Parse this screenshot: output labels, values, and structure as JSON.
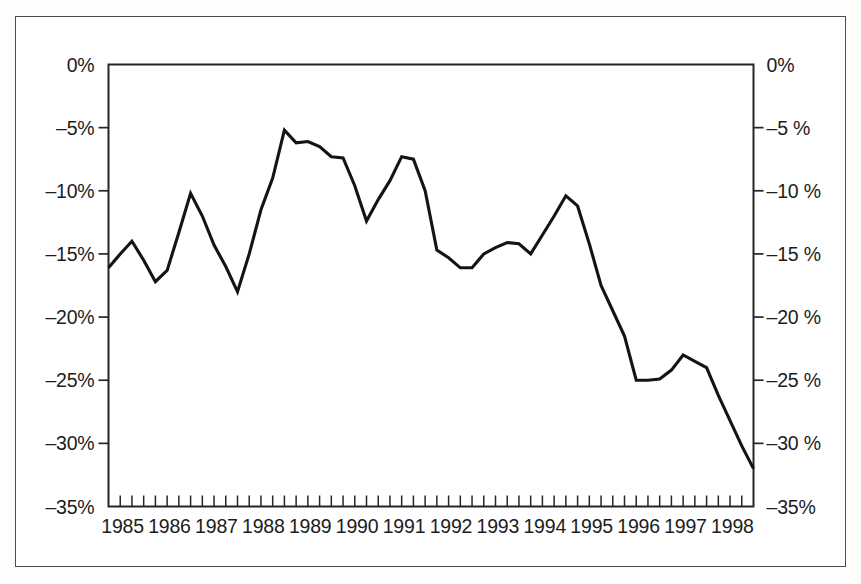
{
  "figure": {
    "background_color": "#ffffff",
    "border_color": "#4c4c4c",
    "line_color": "#141414"
  },
  "chart_data": {
    "type": "line",
    "title": "",
    "subtitle": "",
    "xlabel": "",
    "ylabel": "",
    "grid": false,
    "legend": null,
    "xlim": [
      1985.0,
      1998.75
    ],
    "ylim": [
      -35,
      0
    ],
    "y_tick_values": [
      0,
      -5,
      -10,
      -15,
      -20,
      -25,
      -30,
      -35
    ],
    "y_tick_labels_left": [
      "0%",
      "–5%",
      "–10%",
      "–15%",
      "–20%",
      "–25%",
      "–30%",
      "–35%"
    ],
    "y_tick_labels_right": [
      "0%",
      "–5 %",
      "–10 %",
      "–15 %",
      "–20 %",
      "–25 %",
      "–30 %",
      "–35%"
    ],
    "x_tick_labels": [
      "1985",
      "1986",
      "1987",
      "1988",
      "1989",
      "1990",
      "1991",
      "1992",
      "1993",
      "1994",
      "1995",
      "1996",
      "1997",
      "1998"
    ],
    "x_minor_ticks_per_year": 4,
    "series": [
      {
        "name": "series-1",
        "x": [
          1985.0,
          1985.25,
          1985.5,
          1985.75,
          1986.0,
          1986.25,
          1986.5,
          1986.75,
          1987.0,
          1987.25,
          1987.5,
          1987.75,
          1988.0,
          1988.25,
          1988.5,
          1988.75,
          1989.0,
          1989.25,
          1989.5,
          1989.75,
          1990.0,
          1990.25,
          1990.5,
          1990.75,
          1991.0,
          1991.25,
          1991.5,
          1991.75,
          1992.0,
          1992.25,
          1992.5,
          1992.75,
          1993.0,
          1993.25,
          1993.5,
          1993.75,
          1994.0,
          1994.25,
          1994.5,
          1994.75,
          1995.0,
          1995.25,
          1995.5,
          1995.75,
          1996.0,
          1996.25,
          1996.5,
          1996.75,
          1997.0,
          1997.25,
          1997.5,
          1997.75,
          1998.0,
          1998.25,
          1998.5,
          1998.75
        ],
        "values": [
          -16.1,
          -15.0,
          -14.0,
          -15.5,
          -17.2,
          -16.3,
          -13.3,
          -10.2,
          -12.0,
          -14.3,
          -16.0,
          -18.0,
          -15.0,
          -11.5,
          -9.0,
          -5.2,
          -6.2,
          -6.1,
          -6.5,
          -7.3,
          -7.4,
          -9.6,
          -12.4,
          -10.7,
          -9.2,
          -7.3,
          -7.5,
          -10.0,
          -14.7,
          -15.3,
          -16.1,
          -16.1,
          -15.0,
          -14.5,
          -14.1,
          -14.2,
          -15.0,
          -13.5,
          -12.0,
          -10.4,
          -11.2,
          -14.2,
          -17.5,
          -19.5,
          -21.5,
          -25.0,
          -25.0,
          -24.9,
          -24.2,
          -23.0,
          -23.5,
          -24.0,
          -26.2,
          -28.2,
          -30.2,
          -32.0
        ]
      }
    ]
  }
}
